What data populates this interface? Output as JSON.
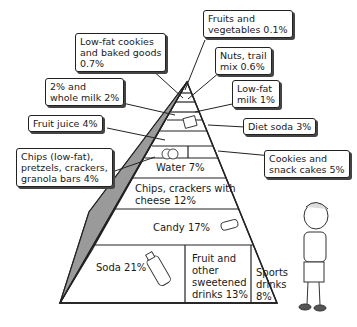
{
  "pyramid_layers": [
    {
      "label": "Water 7%"
    },
    {
      "label": "Chips, crackers with\ncheese 12%"
    },
    {
      "label": "Candy 17%"
    }
  ],
  "base_sections": [
    {
      "label": "Soda 21%"
    },
    {
      "label": "Fruit and\nother\nsweetened\ndrinks 13%"
    },
    {
      "label": "Sports\ndrinks\n8%"
    }
  ],
  "callouts": {
    "fruits_veg": "Fruits and\nvegetables 0.1%",
    "lowfat_cookies": "Low-fat cookies\nand baked goods\n0.7%",
    "nuts": "Nuts, trail\nmix 0.6%",
    "whole_milk": "2% and\nwhole milk 2%",
    "lowfat_milk": "Low-fat\nmilk 1%",
    "fruit_juice": "Fruit juice 4%",
    "diet_soda": "Diet soda 3%",
    "chips_lowfat": "Chips (low-fat),\npretzels, crackers,\ngranola bars 4%",
    "cookies_snack": "Cookies and\nsnack cakes 5%"
  }
}
